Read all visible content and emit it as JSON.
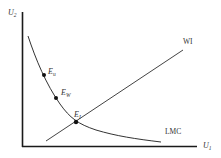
{
  "diagram": {
    "axes": {
      "y_label": "U",
      "y_label_sub": "2",
      "x_label": "U",
      "x_label_sub": "1"
    },
    "curves": {
      "line_label": "WI",
      "curve_label": "LMC"
    },
    "points": [
      {
        "label": "E",
        "sub": "u"
      },
      {
        "label": "E",
        "sub": "W"
      },
      {
        "label": "E",
        "sub": "I"
      }
    ],
    "colors": {
      "axis": "#1a1a1a",
      "curve": "#333333",
      "text": "#333333"
    }
  }
}
